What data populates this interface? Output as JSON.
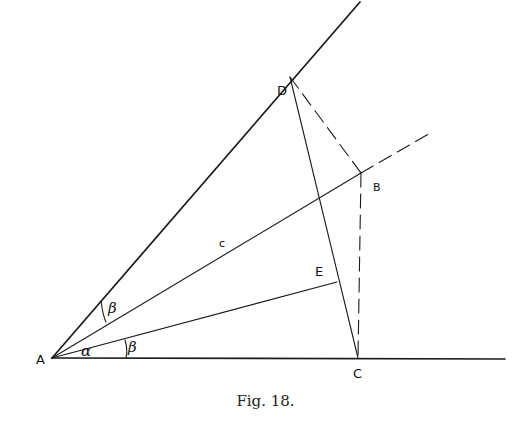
{
  "figure": {
    "caption": "Fig. 18.",
    "points": {
      "A": {
        "label": "A",
        "x": 52,
        "y": 358
      },
      "B": {
        "label": "B",
        "x": 361,
        "y": 173
      },
      "C": {
        "label": "C",
        "x": 358,
        "y": 358
      },
      "D": {
        "label": "D",
        "x": 290,
        "y": 77
      },
      "E": {
        "label": "E",
        "x": 337,
        "y": 282
      }
    },
    "segment_labels": {
      "AB": "c"
    },
    "angle_labels": {
      "alpha": "α",
      "beta_upper": "β",
      "beta_lower": "β"
    },
    "lines": [
      {
        "id": "AD-ray",
        "from": "A",
        "to": [
          360,
          2
        ],
        "style": "solid"
      },
      {
        "id": "AC-ray",
        "from": "A",
        "to": [
          505,
          359
        ],
        "style": "solid"
      },
      {
        "id": "AB",
        "from": "A",
        "to": "B",
        "style": "solid"
      },
      {
        "id": "AB-extension",
        "from": "B",
        "to": [
          432,
          132
        ],
        "style": "dashed"
      },
      {
        "id": "AE",
        "from": "A",
        "to": "E",
        "style": "solid"
      },
      {
        "id": "DC",
        "from": "D",
        "to": "C",
        "style": "solid"
      },
      {
        "id": "DB",
        "from": "D",
        "to": "B",
        "style": "dashed"
      },
      {
        "id": "BC",
        "from": "B",
        "to": "C",
        "style": "dashed"
      }
    ],
    "colors": {
      "ink": "#1a1a1a",
      "background": "#ffffff"
    }
  }
}
